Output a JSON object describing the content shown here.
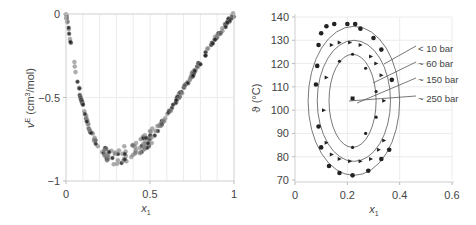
{
  "chart_data": [
    {
      "type": "scatter",
      "title": "",
      "xlabel": "x1",
      "ylabel": "vE (cm3/mol)",
      "xlim": [
        0,
        1
      ],
      "ylim": [
        -1,
        0
      ],
      "xticks": [
        "0",
        "0.5",
        "1"
      ],
      "yticks": [
        "0",
        "-0.5",
        "-1"
      ],
      "grid": true,
      "description": "Excess molar volume vs mole fraction; parabolic-shaped data with minimum near x1=0.35, vE≈-0.85",
      "series": [
        {
          "name": "vE data",
          "x": [
            0.0,
            0.01,
            0.02,
            0.03,
            0.04,
            0.05,
            0.06,
            0.07,
            0.08,
            0.09,
            0.1,
            0.12,
            0.14,
            0.16,
            0.18,
            0.2,
            0.22,
            0.24,
            0.26,
            0.28,
            0.3,
            0.32,
            0.34,
            0.36,
            0.38,
            0.4,
            0.42,
            0.44,
            0.46,
            0.48,
            0.5,
            0.52,
            0.55,
            0.58,
            0.6,
            0.63,
            0.66,
            0.7,
            0.73,
            0.76,
            0.8,
            0.83,
            0.86,
            0.9,
            0.93,
            0.96,
            1.0
          ],
          "y": [
            0.0,
            -0.06,
            -0.12,
            -0.18,
            -0.24,
            -0.3,
            -0.36,
            -0.41,
            -0.46,
            -0.51,
            -0.55,
            -0.62,
            -0.69,
            -0.73,
            -0.77,
            -0.8,
            -0.82,
            -0.83,
            -0.84,
            -0.85,
            -0.85,
            -0.85,
            -0.84,
            -0.84,
            -0.83,
            -0.82,
            -0.81,
            -0.79,
            -0.78,
            -0.76,
            -0.74,
            -0.72,
            -0.68,
            -0.64,
            -0.6,
            -0.56,
            -0.51,
            -0.45,
            -0.4,
            -0.35,
            -0.29,
            -0.24,
            -0.19,
            -0.13,
            -0.09,
            -0.05,
            0.0
          ]
        }
      ]
    },
    {
      "type": "scatter",
      "title": "",
      "xlabel": "x1",
      "ylabel": "ϑ (°C)",
      "xlim": [
        0,
        0.6
      ],
      "ylim": [
        70,
        140
      ],
      "xticks": [
        "0",
        "0.2",
        "0.4",
        "0.6"
      ],
      "yticks": [
        "70",
        "80",
        "90",
        "100",
        "110",
        "120",
        "130",
        "140"
      ],
      "grid": true,
      "description": "Closed-loop miscibility gaps at different pressures; ellipses shrink with increasing pressure",
      "annotations": [
        "< 10 bar",
        "~ 60 bar",
        "~ 150 bar",
        "~ 250 bar"
      ],
      "series": [
        {
          "name": "< 10 bar",
          "x": [
            0.08,
            0.085,
            0.09,
            0.1,
            0.12,
            0.15,
            0.2,
            0.23,
            0.25,
            0.3,
            0.33,
            0.37,
            0.36,
            0.33,
            0.28,
            0.22,
            0.17,
            0.13,
            0.1,
            0.09
          ],
          "y": [
            111,
            119,
            128,
            133,
            136,
            137,
            137,
            137,
            135,
            131,
            126,
            113,
            83,
            79,
            74,
            72,
            73,
            76,
            84,
            93
          ]
        },
        {
          "name": "~ 60 bar",
          "x": [
            0.11,
            0.12,
            0.14,
            0.17,
            0.21,
            0.25,
            0.29,
            0.31,
            0.33,
            0.34,
            0.34,
            0.32,
            0.29,
            0.25,
            0.21,
            0.17,
            0.14,
            0.12
          ],
          "y": [
            100,
            114,
            128,
            129,
            129,
            128,
            123,
            120,
            115,
            104,
            87,
            83,
            79,
            78,
            78,
            79,
            81,
            86
          ]
        },
        {
          "name": "~ 150 bar",
          "x": [
            0.17,
            0.22,
            0.27,
            0.31,
            0.31,
            0.27,
            0.22
          ],
          "y": [
            121,
            124,
            118,
            108,
            97,
            90,
            84
          ]
        },
        {
          "name": "~ 250 bar",
          "x": [
            0.22
          ],
          "y": [
            105
          ]
        }
      ],
      "curves": [
        {
          "name": "< 10 bar",
          "center": [
            0.225,
            104
          ],
          "rx": 0.175,
          "ry": 32
        },
        {
          "name": "~ 60 bar",
          "center": [
            0.225,
            104
          ],
          "rx": 0.14,
          "ry": 26
        },
        {
          "name": "~ 150 bar",
          "center": [
            0.22,
            104
          ],
          "rx": 0.09,
          "ry": 20
        }
      ]
    }
  ],
  "left_chart": {
    "y_label": "v",
    "y_label_sup": "E",
    "y_label_unit": " (cm",
    "y_label_unit_sup": "3",
    "y_label_unit_end": "/mol)",
    "x_label": "x",
    "x_label_sub": "1",
    "yticks": [
      {
        "v": 0,
        "label": "0"
      },
      {
        "v": -0.5,
        "label": "−0.5"
      },
      {
        "v": -1,
        "label": "−1"
      }
    ],
    "xticks": [
      {
        "v": 0,
        "label": "0"
      },
      {
        "v": 0.5,
        "label": "0.5"
      },
      {
        "v": 1,
        "label": "1"
      }
    ]
  },
  "right_chart": {
    "y_label": "ϑ (°C)",
    "x_label": "x",
    "x_label_sub": "1",
    "yticks": [
      {
        "v": 140,
        "label": "140"
      },
      {
        "v": 130,
        "label": "130"
      },
      {
        "v": 120,
        "label": "120"
      },
      {
        "v": 110,
        "label": "110"
      },
      {
        "v": 100,
        "label": "100"
      },
      {
        "v": 90,
        "label": "90"
      },
      {
        "v": 80,
        "label": "80"
      },
      {
        "v": 70,
        "label": "70"
      }
    ],
    "xticks": [
      {
        "v": 0,
        "label": "0"
      },
      {
        "v": 0.2,
        "label": "0.2"
      },
      {
        "v": 0.4,
        "label": "0.4"
      },
      {
        "v": 0.6,
        "label": "0.6"
      }
    ],
    "annotations": [
      {
        "label": "< 10 bar"
      },
      {
        "label": "~ 60 bar"
      },
      {
        "label": "~ 150 bar"
      },
      {
        "label": "~ 250 bar"
      }
    ]
  },
  "colors": {
    "axis": "#bbbbbb",
    "grid": "#ececec",
    "marker_dark": "#222222",
    "marker_gray": "#777777",
    "curve": "#555555",
    "text": "#444444"
  }
}
